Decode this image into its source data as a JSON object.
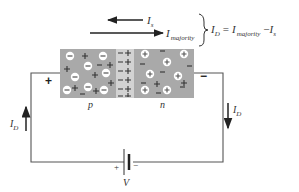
{
  "diagram": {
    "labels": {
      "is_main": "I",
      "is_sub": "s",
      "imaj_main": "I",
      "imaj_sub": "majority",
      "eq_id_main": "I",
      "eq_id_sub": "D",
      "eq_equals": "=",
      "eq_imaj_main": "I",
      "eq_imaj_sub": "majority",
      "eq_minus": "−",
      "eq_is_main": "I",
      "eq_is_sub": "s",
      "p_region": "p",
      "n_region": "n",
      "left_plus": "+",
      "right_minus": "−",
      "id_left_main": "I",
      "id_left_sub": "D",
      "id_right_main": "I",
      "id_right_sub": "D",
      "battery_plus": "+",
      "battery_minus": "−",
      "battery_label": "V"
    },
    "equation": "I_D = I_majority − I_s",
    "colors": {
      "block": "#a9a9a9",
      "depletion": "#d4d4d4",
      "wire": "#555555",
      "ion_fill": "#ffffff",
      "text": "#333333"
    }
  }
}
